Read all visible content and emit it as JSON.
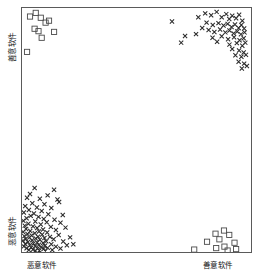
{
  "figure": {
    "kind": "scatter-plot",
    "background": "#ffffff",
    "frame_color": "#5a5a5a"
  },
  "axes": {
    "x": {
      "left_label": "恶意软件",
      "right_label": "善意软件"
    },
    "y": {
      "top_label": "善意软件",
      "bottom_label": "恶意软件"
    }
  },
  "chart_data": {
    "type": "scatter",
    "title": "",
    "xlabel": "恶意软件 / 善意软件",
    "ylabel": "恶意软件 / 善意软件",
    "xlim": [
      0,
      1
    ],
    "ylim": [
      0,
      1
    ],
    "grid": false,
    "legend": "none",
    "marker_colors": {
      "square": "#4a4a4a",
      "cross": "#2b2b2b"
    },
    "series": [
      {
        "name": "square-cluster-top-left",
        "marker": "open-square",
        "color": "#4a4a4a",
        "points": [
          [
            0.035,
            0.965
          ],
          [
            0.06,
            0.98
          ],
          [
            0.082,
            0.96
          ],
          [
            0.103,
            0.94
          ],
          [
            0.118,
            0.948
          ],
          [
            0.055,
            0.915
          ],
          [
            0.072,
            0.905
          ],
          [
            0.14,
            0.902
          ],
          [
            0.086,
            0.878
          ],
          [
            0.022,
            0.82
          ]
        ]
      },
      {
        "name": "square-cluster-bottom-right",
        "marker": "open-square",
        "color": "#4a4a4a",
        "points": [
          [
            0.845,
            0.075
          ],
          [
            0.882,
            0.088
          ],
          [
            0.905,
            0.07
          ],
          [
            0.862,
            0.052
          ],
          [
            0.808,
            0.042
          ],
          [
            0.928,
            0.038
          ],
          [
            0.884,
            0.022
          ],
          [
            0.848,
            0.016
          ],
          [
            0.935,
            0.012
          ],
          [
            0.752,
            0.01
          ],
          [
            0.898,
            0.006
          ]
        ]
      },
      {
        "name": "cross-cluster-top-right",
        "marker": "x",
        "color": "#2b2b2b",
        "points": [
          [
            0.655,
            0.945
          ],
          [
            0.77,
            0.962
          ],
          [
            0.8,
            0.978
          ],
          [
            0.826,
            0.97
          ],
          [
            0.85,
            0.984
          ],
          [
            0.872,
            0.962
          ],
          [
            0.892,
            0.975
          ],
          [
            0.905,
            0.955
          ],
          [
            0.918,
            0.968
          ],
          [
            0.935,
            0.958
          ],
          [
            0.948,
            0.972
          ],
          [
            0.962,
            0.948
          ],
          [
            0.806,
            0.94
          ],
          [
            0.833,
            0.93
          ],
          [
            0.858,
            0.938
          ],
          [
            0.88,
            0.928
          ],
          [
            0.898,
            0.935
          ],
          [
            0.915,
            0.922
          ],
          [
            0.93,
            0.932
          ],
          [
            0.946,
            0.918
          ],
          [
            0.958,
            0.93
          ],
          [
            0.97,
            0.916
          ],
          [
            0.787,
            0.918
          ],
          [
            0.815,
            0.91
          ],
          [
            0.84,
            0.902
          ],
          [
            0.865,
            0.912
          ],
          [
            0.888,
            0.9
          ],
          [
            0.906,
            0.908
          ],
          [
            0.924,
            0.896
          ],
          [
            0.94,
            0.904
          ],
          [
            0.956,
            0.892
          ],
          [
            0.972,
            0.9
          ],
          [
            0.712,
            0.885
          ],
          [
            0.76,
            0.893
          ],
          [
            0.832,
            0.878
          ],
          [
            0.872,
            0.884
          ],
          [
            0.9,
            0.872
          ],
          [
            0.926,
            0.88
          ],
          [
            0.95,
            0.868
          ],
          [
            0.968,
            0.876
          ],
          [
            0.695,
            0.858
          ],
          [
            0.852,
            0.862
          ],
          [
            0.906,
            0.85
          ],
          [
            0.938,
            0.856
          ],
          [
            0.962,
            0.845
          ],
          [
            0.975,
            0.858
          ],
          [
            0.918,
            0.832
          ],
          [
            0.948,
            0.826
          ],
          [
            0.968,
            0.818
          ],
          [
            0.932,
            0.806
          ],
          [
            0.958,
            0.8
          ],
          [
            0.978,
            0.808
          ],
          [
            0.946,
            0.78
          ],
          [
            0.97,
            0.772
          ],
          [
            0.96,
            0.752
          ],
          [
            0.982,
            0.762
          ]
        ]
      },
      {
        "name": "cross-cluster-bottom-left",
        "marker": "x",
        "color": "#2b2b2b",
        "points": [
          [
            0.055,
            0.262
          ],
          [
            0.14,
            0.255
          ],
          [
            0.035,
            0.238
          ],
          [
            0.112,
            0.232
          ],
          [
            0.022,
            0.222
          ],
          [
            0.078,
            0.218
          ],
          [
            0.155,
            0.215
          ],
          [
            0.162,
            0.205
          ],
          [
            0.045,
            0.2
          ],
          [
            0.098,
            0.196
          ],
          [
            0.014,
            0.188
          ],
          [
            0.065,
            0.182
          ],
          [
            0.128,
            0.18
          ],
          [
            0.03,
            0.172
          ],
          [
            0.086,
            0.168
          ],
          [
            0.008,
            0.162
          ],
          [
            0.052,
            0.158
          ],
          [
            0.115,
            0.155
          ],
          [
            0.178,
            0.152
          ],
          [
            0.038,
            0.148
          ],
          [
            0.072,
            0.144
          ],
          [
            0.02,
            0.138
          ],
          [
            0.095,
            0.135
          ],
          [
            0.142,
            0.132
          ],
          [
            0.006,
            0.128
          ],
          [
            0.058,
            0.125
          ],
          [
            0.108,
            0.122
          ],
          [
            0.168,
            0.12
          ],
          [
            0.028,
            0.116
          ],
          [
            0.082,
            0.113
          ],
          [
            0.012,
            0.108
          ],
          [
            0.048,
            0.105
          ],
          [
            0.126,
            0.103
          ],
          [
            0.19,
            0.1
          ],
          [
            0.066,
            0.098
          ],
          [
            0.018,
            0.094
          ],
          [
            0.092,
            0.092
          ],
          [
            0.148,
            0.09
          ],
          [
            0.036,
            0.086
          ],
          [
            0.074,
            0.084
          ],
          [
            0.005,
            0.082
          ],
          [
            0.11,
            0.08
          ],
          [
            0.056,
            0.077
          ],
          [
            0.024,
            0.074
          ],
          [
            0.088,
            0.072
          ],
          [
            0.16,
            0.07
          ],
          [
            0.042,
            0.068
          ],
          [
            0.01,
            0.065
          ],
          [
            0.07,
            0.063
          ],
          [
            0.122,
            0.062
          ],
          [
            0.032,
            0.059
          ],
          [
            0.098,
            0.057
          ],
          [
            0.06,
            0.055
          ],
          [
            0.016,
            0.053
          ],
          [
            0.138,
            0.052
          ],
          [
            0.078,
            0.05
          ],
          [
            0.044,
            0.048
          ],
          [
            0.004,
            0.046
          ],
          [
            0.106,
            0.044
          ],
          [
            0.18,
            0.043
          ],
          [
            0.026,
            0.041
          ],
          [
            0.066,
            0.039
          ],
          [
            0.092,
            0.037
          ],
          [
            0.05,
            0.035
          ],
          [
            0.014,
            0.033
          ],
          [
            0.128,
            0.032
          ],
          [
            0.074,
            0.03
          ],
          [
            0.034,
            0.028
          ],
          [
            0.1,
            0.026
          ],
          [
            0.058,
            0.024
          ],
          [
            0.008,
            0.023
          ],
          [
            0.148,
            0.022
          ],
          [
            0.084,
            0.02
          ],
          [
            0.04,
            0.018
          ],
          [
            0.112,
            0.017
          ],
          [
            0.02,
            0.015
          ],
          [
            0.068,
            0.014
          ],
          [
            0.094,
            0.012
          ],
          [
            0.048,
            0.01
          ],
          [
            0.03,
            0.008
          ],
          [
            0.132,
            0.008
          ],
          [
            0.076,
            0.006
          ],
          [
            0.058,
            0.005
          ],
          [
            0.102,
            0.004
          ],
          [
            0.168,
            0.014
          ],
          [
            0.21,
            0.06
          ],
          [
            0.196,
            0.028
          ],
          [
            0.224,
            0.032
          ]
        ]
      }
    ]
  }
}
